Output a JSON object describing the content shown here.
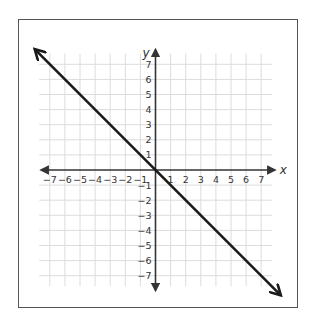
{
  "chart_data": {
    "type": "line",
    "title": "",
    "xlabel": "x",
    "ylabel": "y",
    "xlim": [
      -7.7,
      7.7
    ],
    "ylim": [
      -7.7,
      7.7
    ],
    "grid": true,
    "legend": null,
    "x_ticks": [
      -7,
      -6,
      -5,
      -4,
      -3,
      -2,
      -1,
      1,
      2,
      3,
      4,
      5,
      6,
      7
    ],
    "y_ticks": [
      7,
      6,
      5,
      4,
      3,
      2,
      1,
      -1,
      -2,
      -3,
      -4,
      -5,
      -6,
      -7
    ],
    "x_tick_labels": [
      "−7",
      "−6",
      "−5",
      "−4",
      "−3",
      "−2",
      "−1",
      "1",
      "2",
      "3",
      "4",
      "5",
      "6",
      "7"
    ],
    "y_tick_labels": [
      "7",
      "6",
      "5",
      "4",
      "3",
      "2",
      "1",
      "−1",
      "−2",
      "−3",
      "−4",
      "−5",
      "−6",
      "−7"
    ],
    "series": [
      {
        "name": "line",
        "equation": "y = -x",
        "x": [
          -8,
          8.3
        ],
        "y": [
          8,
          -8.3
        ],
        "arrows": "both",
        "color": "#1a1a1a"
      }
    ]
  },
  "colors": {
    "grid": "#dcdcdc",
    "axis": "#333333",
    "line": "#1a1a1a",
    "frame": "#555555"
  }
}
